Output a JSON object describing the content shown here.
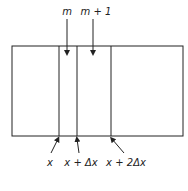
{
  "diagram": {
    "top_labels": [
      {
        "text": "m",
        "x": 67
      },
      {
        "text": "m + 1",
        "x": 93
      }
    ],
    "bottom_labels": [
      {
        "text": "x",
        "x": 50
      },
      {
        "text": "x + Δx",
        "x": 78
      },
      {
        "text": "x + 2Δx",
        "x": 123
      }
    ],
    "grid_lines_x": [
      59,
      77,
      111
    ],
    "colors": {
      "line": "#222222",
      "background": "#ffffff"
    }
  }
}
